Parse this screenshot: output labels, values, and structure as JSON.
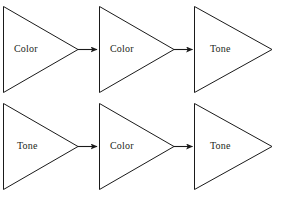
{
  "diagram": {
    "type": "flow-chain",
    "background_color": "#ffffff",
    "stroke_color": "#1a1a1a",
    "text_color": "#231f20",
    "shape": "right-pointing-triangle",
    "rows": [
      {
        "row_index": 0,
        "nodes": [
          {
            "label": "Color",
            "x": 3,
            "y": 6,
            "width": 75,
            "height": 87,
            "label_x": 14,
            "label_y": 45
          },
          {
            "label": "Color",
            "x": 99,
            "y": 6,
            "width": 75,
            "height": 87,
            "label_x": 110,
            "label_y": 45
          },
          {
            "label": "Tone",
            "x": 194,
            "y": 6,
            "width": 78,
            "height": 87,
            "label_x": 209,
            "label_y": 45
          }
        ],
        "arrows": [
          {
            "from": 0,
            "to": 1,
            "x1": 79,
            "x2": 98,
            "y": 50
          },
          {
            "from": 1,
            "to": 2,
            "x1": 175,
            "x2": 193,
            "y": 50
          }
        ]
      },
      {
        "row_index": 1,
        "nodes": [
          {
            "label": "Tone",
            "x": 3,
            "y": 103,
            "width": 75,
            "height": 87,
            "label_x": 16,
            "label_y": 142
          },
          {
            "label": "Color",
            "x": 99,
            "y": 103,
            "width": 75,
            "height": 87,
            "label_x": 110,
            "label_y": 142
          },
          {
            "label": "Tone",
            "x": 194,
            "y": 103,
            "width": 78,
            "height": 87,
            "label_x": 209,
            "label_y": 142
          }
        ],
        "arrows": [
          {
            "from": 0,
            "to": 1,
            "x1": 79,
            "x2": 98,
            "y": 147
          },
          {
            "from": 1,
            "to": 2,
            "x1": 175,
            "x2": 193,
            "y": 147
          }
        ]
      }
    ],
    "labels": {
      "n00": "Color",
      "n01": "Color",
      "n02": "Tone",
      "n10": "Tone",
      "n11": "Color",
      "n12": "Tone"
    }
  }
}
